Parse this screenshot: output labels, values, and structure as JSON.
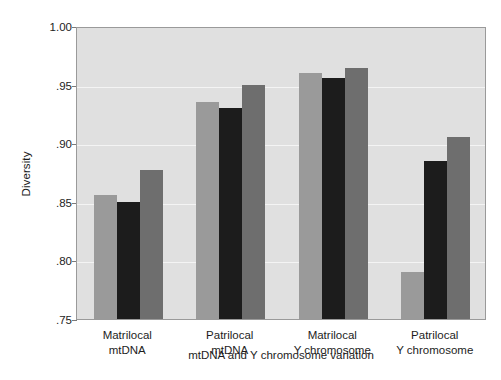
{
  "chart_data": {
    "type": "bar",
    "title": "",
    "xlabel": "mtDNA and Y chromosome variation",
    "ylabel": "Diversity",
    "categories": [
      "Matrilocal mtDNA",
      "Patrilocal mtDNA",
      "Matrilocal Y chromosome",
      "Patrilocal Y chromosome"
    ],
    "category_lines": [
      [
        "Matrilocal",
        "mtDNA"
      ],
      [
        "Patrilocal",
        "mtDNA"
      ],
      [
        "Matrilocal",
        "Y chromosome"
      ],
      [
        "Patrilocal",
        "Y chromosome"
      ]
    ],
    "series": [
      {
        "name": "series-1",
        "color": "#9a9a9a",
        "values": [
          0.856,
          0.935,
          0.96,
          0.79
        ]
      },
      {
        "name": "series-2",
        "color": "#1c1c1c",
        "values": [
          0.85,
          0.93,
          0.956,
          0.885
        ]
      },
      {
        "name": "series-3",
        "color": "#6e6e6e",
        "values": [
          0.877,
          0.95,
          0.964,
          0.905
        ]
      }
    ],
    "ylim": [
      0.75,
      1.0
    ],
    "yticks": [
      1.0,
      0.95,
      0.9,
      0.85,
      0.8,
      0.75
    ],
    "ytick_labels": [
      "1.00",
      ".95",
      ".90",
      ".85",
      ".80",
      ".75"
    ],
    "grid": true,
    "gridlines_at": [
      0.95,
      0.9,
      0.85,
      0.8
    ],
    "legend": "none",
    "plot_background": "#e0e0e0",
    "gridline_color": "#f4f4f4",
    "axis_color": "#9a9a9a",
    "text_color": "#1d1d1d"
  }
}
